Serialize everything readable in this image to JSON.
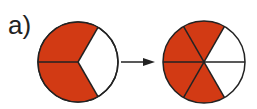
{
  "label": "a)",
  "colors": {
    "fill": "#d23a14",
    "stroke": "#222222",
    "empty": "#ffffff"
  },
  "left_circle": {
    "name": "thirds",
    "parts": 3,
    "shaded": 2
  },
  "right_circle": {
    "name": "sixths",
    "parts": 6,
    "shaded": 4
  },
  "arrow": "right-arrow"
}
